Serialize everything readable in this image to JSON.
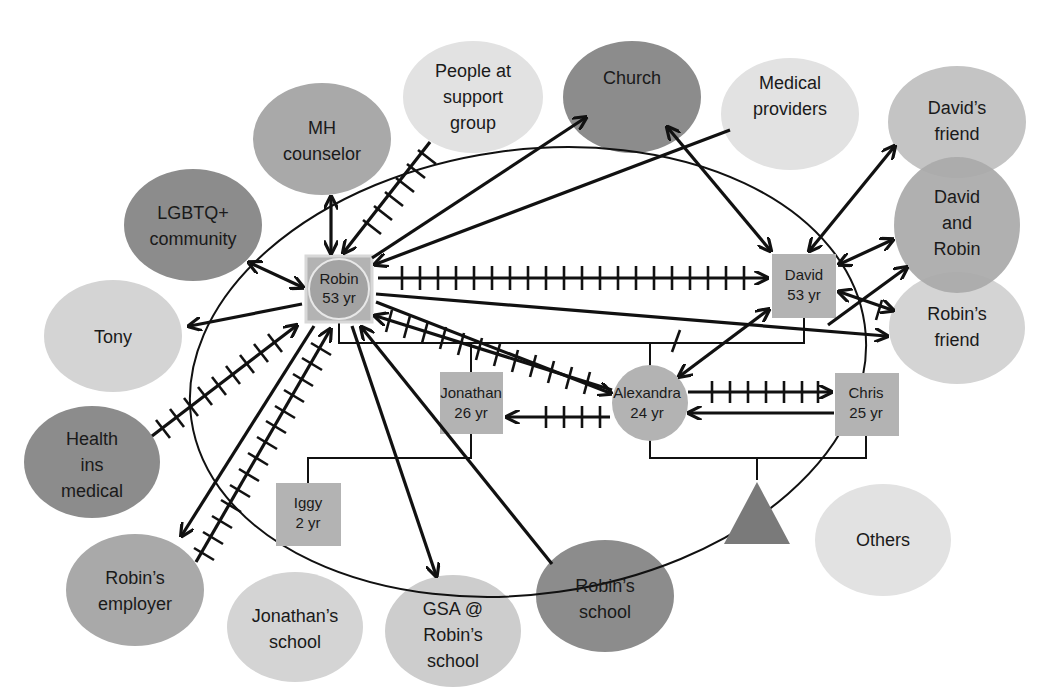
{
  "diagram": {
    "type": "ecomap",
    "colors": {
      "dark": "#8c8c8c",
      "medium": "#a9a9a9",
      "light": "#cdcdcd",
      "lightest": "#e2e2e2",
      "family_box": "#b3b3b3",
      "triangle": "#7a7a7a",
      "line": "#111111"
    },
    "family": {
      "robin": {
        "name": "Robin",
        "age": "53 yr"
      },
      "david": {
        "name": "David",
        "age": "53 yr"
      },
      "jonathan": {
        "name": "Jonathan",
        "age": "26 yr"
      },
      "alexandra": {
        "name": "Alexandra",
        "age": "24 yr"
      },
      "chris": {
        "name": "Chris",
        "age": "25 yr"
      },
      "iggy": {
        "name": "Iggy",
        "age": "2 yr"
      }
    },
    "external": {
      "people_support": [
        "People at",
        "support",
        "group"
      ],
      "church": [
        "Church"
      ],
      "medical_providers": [
        "Medical",
        "providers"
      ],
      "davids_friend": [
        "David’s",
        "friend"
      ],
      "david_and_robin": [
        "David",
        "and",
        "Robin"
      ],
      "robins_friend": [
        "Robin’s",
        "friend"
      ],
      "mh_counselor": [
        "MH",
        "counselor"
      ],
      "lgbtq": [
        "LGBTQ+",
        "community"
      ],
      "tony": [
        "Tony"
      ],
      "health_ins": [
        "Health",
        "ins",
        "medical"
      ],
      "robins_employer": [
        "Robin’s",
        "employer"
      ],
      "jonathans_school": [
        "Jonathan’s",
        "school"
      ],
      "gsa": [
        "GSA @",
        "Robin’s",
        "school"
      ],
      "robins_school": [
        "Robin’s",
        "school"
      ],
      "others": [
        "Others"
      ]
    }
  }
}
